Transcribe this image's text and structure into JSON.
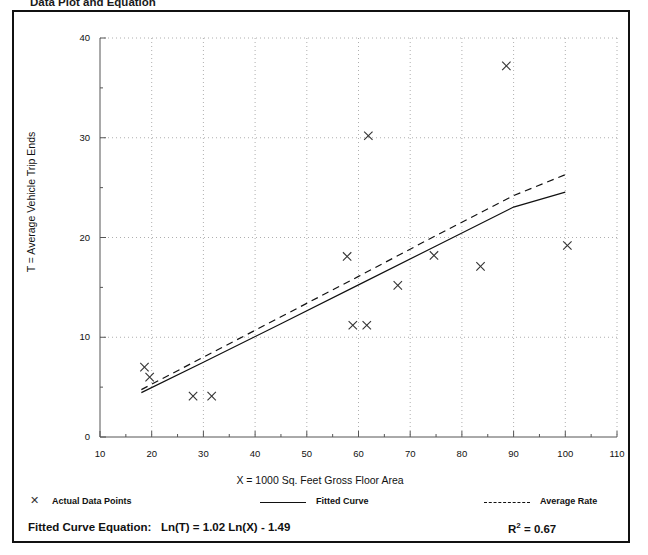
{
  "document": {
    "title": "Data Plot and Equation"
  },
  "chart_data": {
    "type": "scatter",
    "title": "",
    "xlabel": "X = 1000 Sq. Feet Gross Floor Area",
    "ylabel": "T = Average Vehicle Trip Ends",
    "xlim": [
      10,
      110
    ],
    "ylim": [
      0,
      40
    ],
    "xticks": [
      10,
      20,
      30,
      40,
      50,
      60,
      70,
      80,
      90,
      100,
      110
    ],
    "yticks": [
      0,
      10,
      20,
      30,
      40
    ],
    "x_minor_step": 5,
    "y_minor_step": 5,
    "grid": true,
    "grid_style": "dotted",
    "legend_position": "below-axis",
    "series": [
      {
        "name": "Actual Data Points",
        "type": "scatter",
        "marker": "x",
        "points": [
          {
            "x": 18.6,
            "y": 7.0
          },
          {
            "x": 19.6,
            "y": 6.0
          },
          {
            "x": 28.0,
            "y": 4.1
          },
          {
            "x": 31.6,
            "y": 4.1
          },
          {
            "x": 57.8,
            "y": 18.1
          },
          {
            "x": 58.9,
            "y": 11.2
          },
          {
            "x": 61.6,
            "y": 11.2
          },
          {
            "x": 61.9,
            "y": 30.2
          },
          {
            "x": 67.6,
            "y": 15.2
          },
          {
            "x": 74.6,
            "y": 18.2
          },
          {
            "x": 83.6,
            "y": 17.1
          },
          {
            "x": 88.6,
            "y": 37.2
          },
          {
            "x": 100.4,
            "y": 19.2
          }
        ]
      },
      {
        "name": "Fitted Curve",
        "type": "line",
        "style": "solid",
        "points": [
          {
            "x": 18.0,
            "y": 4.45
          },
          {
            "x": 30.0,
            "y": 7.5
          },
          {
            "x": 45.0,
            "y": 11.35
          },
          {
            "x": 60.0,
            "y": 15.25
          },
          {
            "x": 75.0,
            "y": 19.15
          },
          {
            "x": 90.0,
            "y": 23.05
          },
          {
            "x": 100.0,
            "y": 24.55
          }
        ]
      },
      {
        "name": "Average Rate",
        "type": "line",
        "style": "dashed",
        "points": [
          {
            "x": 18.0,
            "y": 4.75
          },
          {
            "x": 30.0,
            "y": 8.0
          },
          {
            "x": 45.0,
            "y": 12.05
          },
          {
            "x": 60.0,
            "y": 16.1
          },
          {
            "x": 75.0,
            "y": 20.2
          },
          {
            "x": 90.0,
            "y": 24.2
          },
          {
            "x": 100.0,
            "y": 26.3
          }
        ]
      }
    ],
    "annotations": {
      "equation_label": "Fitted Curve Equation:",
      "equation": "Ln(T) = 1.02 Ln(X) - 1.49",
      "r_squared_label": "R",
      "r_squared_exponent": "2",
      "r_squared_value": "= 0.67"
    }
  },
  "legend": {
    "items": [
      {
        "label": "Actual Data Points",
        "marker": "x-marker-icon"
      },
      {
        "label": "Fitted Curve",
        "marker": "solid-line-icon"
      },
      {
        "label": "Average Rate",
        "marker": "dashed-line-icon"
      }
    ]
  },
  "colors": {
    "ink": "#111111",
    "grid": "#9a9a9a",
    "axis": "#555555",
    "marker": "#333333"
  }
}
